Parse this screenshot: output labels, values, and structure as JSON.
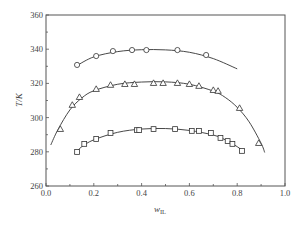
{
  "chart_data": {
    "type": "scatter",
    "title": "",
    "xlabel": "w_IL",
    "xlabel_main": "w",
    "xlabel_sub": "IL",
    "ylabel": "T/K",
    "xlim": [
      0.0,
      1.0
    ],
    "ylim": [
      260,
      360
    ],
    "xticks": [
      "0.0",
      "0.2",
      "0.4",
      "0.6",
      "0.8",
      "1.0"
    ],
    "yticks": [
      "260",
      "280",
      "300",
      "320",
      "340",
      "360"
    ],
    "grid": false,
    "legend": "none",
    "series": [
      {
        "name": "circles",
        "marker": "circle",
        "points": [
          [
            0.13,
            330.8
          ],
          [
            0.21,
            336.0
          ],
          [
            0.28,
            338.9
          ],
          [
            0.36,
            339.5
          ],
          [
            0.42,
            339.5
          ],
          [
            0.55,
            339.5
          ],
          [
            0.67,
            336.6
          ]
        ],
        "fit_curve": [
          [
            0.13,
            330.5
          ],
          [
            0.2,
            335.5
          ],
          [
            0.3,
            338.6
          ],
          [
            0.4,
            339.7
          ],
          [
            0.5,
            339.6
          ],
          [
            0.6,
            338.2
          ],
          [
            0.7,
            334.5
          ],
          [
            0.8,
            328.5
          ]
        ]
      },
      {
        "name": "triangles",
        "marker": "triangle",
        "points": [
          [
            0.06,
            293.3
          ],
          [
            0.11,
            307.4
          ],
          [
            0.14,
            312.0
          ],
          [
            0.21,
            316.7
          ],
          [
            0.27,
            319.1
          ],
          [
            0.33,
            319.6
          ],
          [
            0.37,
            319.6
          ],
          [
            0.45,
            320.2
          ],
          [
            0.49,
            320.2
          ],
          [
            0.55,
            320.2
          ],
          [
            0.6,
            319.6
          ],
          [
            0.64,
            318.5
          ],
          [
            0.7,
            316.1
          ],
          [
            0.72,
            315.6
          ],
          [
            0.81,
            305.6
          ],
          [
            0.89,
            285.1
          ]
        ],
        "fit_curve": [
          [
            0.02,
            284.0
          ],
          [
            0.05,
            293.0
          ],
          [
            0.1,
            304.5
          ],
          [
            0.15,
            311.5
          ],
          [
            0.2,
            315.7
          ],
          [
            0.3,
            319.5
          ],
          [
            0.4,
            320.8
          ],
          [
            0.5,
            320.9
          ],
          [
            0.6,
            319.5
          ],
          [
            0.7,
            315.5
          ],
          [
            0.75,
            311.8
          ],
          [
            0.8,
            306.0
          ],
          [
            0.85,
            297.5
          ],
          [
            0.9,
            285.0
          ],
          [
            0.915,
            279.6
          ]
        ]
      },
      {
        "name": "squares",
        "marker": "square",
        "points": [
          [
            0.13,
            279.9
          ],
          [
            0.16,
            284.6
          ],
          [
            0.21,
            287.5
          ],
          [
            0.27,
            291.0
          ],
          [
            0.38,
            292.7
          ],
          [
            0.39,
            292.7
          ],
          [
            0.45,
            293.3
          ],
          [
            0.54,
            293.3
          ],
          [
            0.61,
            292.2
          ],
          [
            0.64,
            292.2
          ],
          [
            0.69,
            291.0
          ],
          [
            0.73,
            288.1
          ],
          [
            0.76,
            286.3
          ],
          [
            0.78,
            284.6
          ],
          [
            0.82,
            280.5
          ]
        ],
        "fit_curve": [
          [
            0.12,
            279.0
          ],
          [
            0.15,
            283.0
          ],
          [
            0.2,
            287.0
          ],
          [
            0.3,
            291.4
          ],
          [
            0.4,
            293.3
          ],
          [
            0.5,
            293.6
          ],
          [
            0.6,
            292.5
          ],
          [
            0.7,
            289.8
          ],
          [
            0.75,
            287.0
          ],
          [
            0.8,
            283.0
          ],
          [
            0.83,
            279.8
          ]
        ]
      }
    ]
  }
}
